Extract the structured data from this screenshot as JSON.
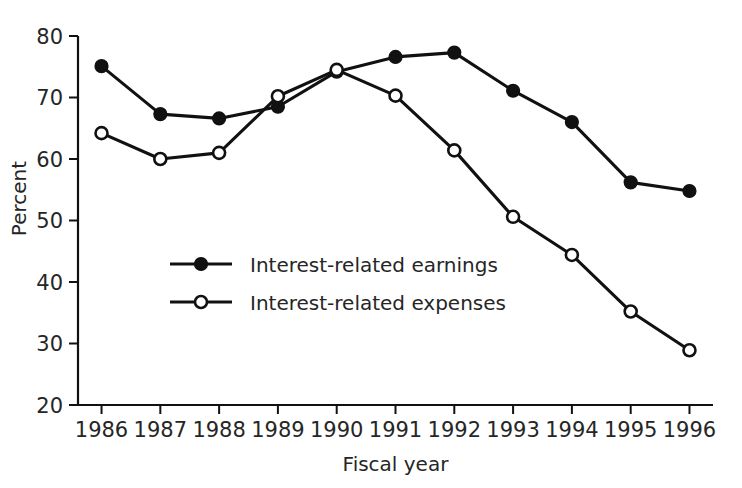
{
  "chart_data": {
    "type": "line",
    "title": "",
    "xlabel": "Fiscal year",
    "ylabel": "Percent",
    "categories": [
      "1986",
      "1987",
      "1988",
      "1989",
      "1990",
      "1991",
      "1992",
      "1993",
      "1994",
      "1995",
      "1996"
    ],
    "x": [
      1986,
      1987,
      1988,
      1989,
      1990,
      1991,
      1992,
      1993,
      1994,
      1995,
      1996
    ],
    "xlim": [
      1985.6,
      1996.4
    ],
    "ylim": [
      20,
      80
    ],
    "ytick_labels": [
      "20",
      "30",
      "40",
      "50",
      "60",
      "70",
      "80"
    ],
    "yticks": [
      20,
      30,
      40,
      50,
      60,
      70,
      80
    ],
    "xtick_labels": [
      "1986",
      "1987",
      "1988",
      "1989",
      "1990",
      "1991",
      "1992",
      "1993",
      "1994",
      "1995",
      "1996"
    ],
    "grid": false,
    "legend_position": "center-left-inside",
    "series": [
      {
        "name": "Interest-related earnings",
        "marker": "filled-circle",
        "color": "#111111",
        "values": [
          75.1,
          67.3,
          66.6,
          68.5,
          74.2,
          76.6,
          77.3,
          71.1,
          66.0,
          56.2,
          54.8
        ]
      },
      {
        "name": "Interest-related expenses",
        "marker": "open-circle",
        "color": "#111111",
        "values": [
          64.2,
          60.0,
          61.0,
          70.2,
          74.5,
          70.3,
          61.4,
          50.6,
          44.4,
          35.2,
          28.9
        ]
      }
    ]
  },
  "legend": {
    "entries": [
      {
        "label": "Interest-related earnings",
        "marker": "filled-circle"
      },
      {
        "label": "Interest-related expenses",
        "marker": "open-circle"
      }
    ]
  },
  "colors": {
    "ink": "#111111",
    "text": "#262626",
    "background": "#ffffff"
  }
}
